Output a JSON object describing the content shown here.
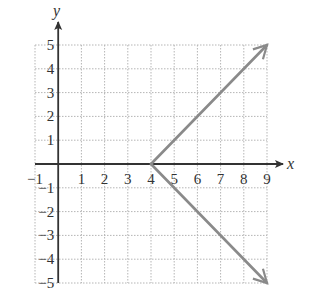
{
  "chart_data": {
    "type": "line",
    "title": "",
    "xlabel": "x",
    "ylabel": "y",
    "xlim": [
      -1,
      9
    ],
    "ylim": [
      -5,
      5
    ],
    "grid": true,
    "grid_style": "dotted",
    "x_ticks": [
      "-1",
      "1",
      "2",
      "3",
      "4",
      "5",
      "6",
      "7",
      "8",
      "9"
    ],
    "y_ticks": [
      "5",
      "4",
      "3",
      "2",
      "1",
      "-1",
      "-2",
      "-3",
      "-4",
      "-5"
    ],
    "series": [
      {
        "name": "upper ray",
        "points": [
          [
            4,
            0
          ],
          [
            9,
            5
          ]
        ],
        "arrow_end": true,
        "color": "#8a8a8a"
      },
      {
        "name": "lower ray",
        "points": [
          [
            4,
            0
          ],
          [
            9,
            -5
          ]
        ],
        "arrow_end": true,
        "color": "#8a8a8a"
      }
    ],
    "vertex": [
      4,
      0
    ]
  },
  "axes": {
    "x_label": "x",
    "y_label": "y",
    "axis_color": "#333333",
    "grid_color": "#b5b5b5",
    "line_color": "#8a8a8a"
  }
}
